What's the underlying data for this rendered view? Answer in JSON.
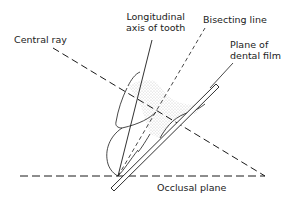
{
  "diagram": {
    "labels": {
      "central_ray": "Central ray",
      "longitudinal_axis_line1": "Longitudinal",
      "longitudinal_axis_line2": "axis of tooth",
      "bisecting_line": "Bisecting line",
      "film_line1": "Plane of",
      "film_line2": "dental film",
      "occlusal_plane": "Occlusal plane"
    },
    "colors": {
      "line": "#1a1a1a",
      "stipple": "#9a9a9a",
      "background": "#ffffff"
    }
  }
}
